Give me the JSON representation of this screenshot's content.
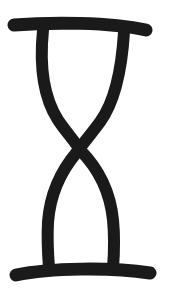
{
  "image": {
    "width": 170,
    "height": 298,
    "background": "#ffffff",
    "ink_color": "#1a1a1a",
    "subject": "hourglass-glyph"
  }
}
